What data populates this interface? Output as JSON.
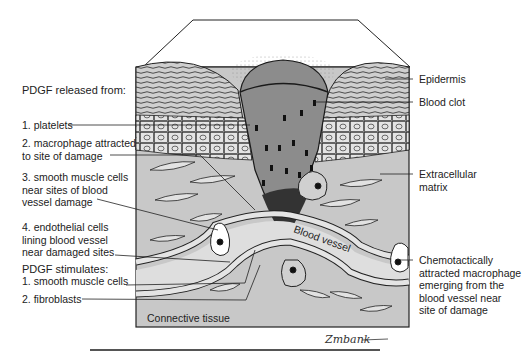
{
  "figure": {
    "released_from": {
      "heading": "PDGF released from:",
      "items": [
        {
          "line1": "1. platelets",
          "line2": "",
          "line3": ""
        },
        {
          "line1": "2. macrophage attracted",
          "line2": "to site of damage",
          "line3": ""
        },
        {
          "line1": "3. smooth muscle cells",
          "line2": "near sites of blood",
          "line3": "vessel damage"
        },
        {
          "line1": "4. endothelial cells",
          "line2": "lining blood vessel",
          "line3": "near damaged sites"
        }
      ]
    },
    "stimulates": {
      "heading": "PDGF stimulates:",
      "items": [
        "1. smooth muscle cells",
        "2. fibroblasts"
      ]
    },
    "right_labels": {
      "epidermis": "Epidermis",
      "blood_clot": "Blood clot",
      "ecm_line1": "Extracellular",
      "ecm_line2": "matrix",
      "macrophage_line1": "Chemotactically",
      "macrophage_line2": "attracted macrophage",
      "macrophage_line3": "emerging from the",
      "macrophage_line4": "blood vessel near",
      "macrophage_line5": "site of damage"
    },
    "inner_labels": {
      "blood_vessel": "Blood vessel",
      "connective_tissue": "Connective tissue"
    },
    "signature": "Zmbank",
    "colors": {
      "tissue_gray": "#c8c8c8",
      "clot_gray": "#8c8c8c",
      "cell_fill": "#e4e4e4",
      "outline": "#1a1a1a",
      "white": "#ffffff"
    }
  }
}
